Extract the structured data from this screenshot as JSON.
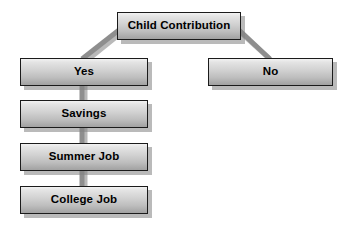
{
  "diagram": {
    "background_color": "#ffffff",
    "node_fill_top": "#f2f2f2",
    "node_fill_bottom": "#a2a2a2",
    "node_border_color": "#1b1b1b",
    "node_text_color": "#000000",
    "connector_color": "#8c8c8c",
    "connector_shadow_color": "#b5b5b5",
    "nodes": [
      {
        "id": "child-contribution",
        "label": "Child Contribution"
      },
      {
        "id": "yes",
        "label": "Yes"
      },
      {
        "id": "no",
        "label": "No"
      },
      {
        "id": "savings",
        "label": "Savings"
      },
      {
        "id": "summer-job",
        "label": "Summer Job"
      },
      {
        "id": "college-job",
        "label": "College Job"
      }
    ],
    "edges": [
      {
        "from": "child-contribution",
        "to": "yes",
        "style": "diagonal"
      },
      {
        "from": "child-contribution",
        "to": "no",
        "style": "diagonal"
      },
      {
        "from": "yes",
        "to": "savings",
        "style": "vertical"
      },
      {
        "from": "savings",
        "to": "summer-job",
        "style": "vertical"
      },
      {
        "from": "summer-job",
        "to": "college-job",
        "style": "vertical"
      }
    ]
  }
}
